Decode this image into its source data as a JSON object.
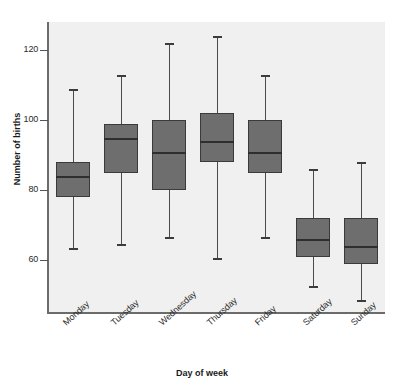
{
  "chart_data": {
    "type": "box",
    "title": "",
    "xlabel": "Day of week",
    "ylabel": "Number of births",
    "ylim": [
      45,
      128
    ],
    "yticks": [
      60,
      80,
      100,
      120
    ],
    "ytick_labels": [
      "60",
      "80",
      "100",
      "120"
    ],
    "grid": false,
    "legend": null,
    "categories": [
      "Monday",
      "Tuesday",
      "Wednesday",
      "Thursday",
      "Friday",
      "Saturday",
      "Sunday"
    ],
    "boxes": [
      {
        "category": "Monday",
        "whisker_low": 63,
        "q1": 78,
        "median": 84,
        "q3": 88,
        "whisker_high": 109
      },
      {
        "category": "Tuesday",
        "whisker_low": 64,
        "q1": 85,
        "median": 95,
        "q3": 99,
        "whisker_high": 113
      },
      {
        "category": "Wednesday",
        "whisker_low": 66,
        "q1": 80,
        "median": 91,
        "q3": 100,
        "whisker_high": 122
      },
      {
        "category": "Thursday",
        "whisker_low": 60,
        "q1": 88,
        "median": 94,
        "q3": 102,
        "whisker_high": 124
      },
      {
        "category": "Friday",
        "whisker_low": 66,
        "q1": 85,
        "median": 91,
        "q3": 100,
        "whisker_high": 113
      },
      {
        "category": "Saturday",
        "whisker_low": 52,
        "q1": 61,
        "median": 66,
        "q3": 72,
        "whisker_high": 86
      },
      {
        "category": "Sunday",
        "whisker_low": 48,
        "q1": 59,
        "median": 64,
        "q3": 72,
        "whisker_high": 88
      }
    ],
    "colors": {
      "box_fill": "#6e6e6e",
      "box_edge": "#3a3a3a",
      "median": "#2e2e2e",
      "whisker": "#4a4a4a",
      "plot_background": "#f0f0f0",
      "axis": "#6b6b6b",
      "figure_background": "#ffffff"
    }
  }
}
